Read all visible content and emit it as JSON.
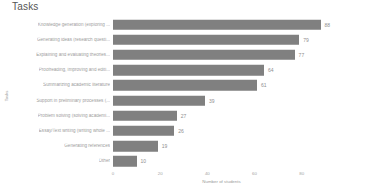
{
  "chart_data": {
    "type": "bar",
    "orientation": "horizontal",
    "title": "Tasks",
    "xlabel": "Number of students",
    "ylabel": "Tasks",
    "xlim": [
      0,
      92
    ],
    "xticks": [
      0,
      20,
      40,
      60,
      80
    ],
    "xtick_labels": [
      "0",
      "20",
      "40",
      "60",
      "80"
    ],
    "grid": false,
    "legend": null,
    "bar_color": "#808080",
    "background": "#ffffff",
    "categories": [
      "Knowledge generation (exploring ...",
      "Generating ideas (research questi...",
      "Explaining and evaluating theories...",
      "Proofreading, improving and editi...",
      "Summarizing academic literature",
      "Support in preliminary processes (...",
      "Problem solving (solving academi...",
      "Essay/Text writing (writing whole ...",
      "Generating references",
      "Other"
    ],
    "values": [
      88,
      79,
      77,
      64,
      61,
      39,
      27,
      26,
      19,
      10
    ],
    "value_labels": [
      "88",
      "79",
      "77",
      "64",
      "61",
      "39",
      "27",
      "26",
      "19",
      "10"
    ]
  }
}
